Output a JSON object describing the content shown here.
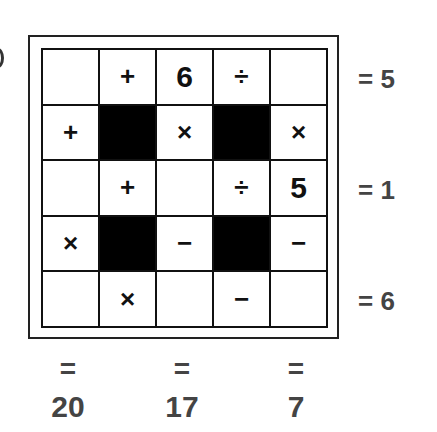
{
  "puzzle": {
    "type": "math-crossword-grid",
    "rows": 5,
    "cols": 5,
    "cells": [
      [
        {
          "kind": "blank",
          "value": ""
        },
        {
          "kind": "op",
          "value": "+"
        },
        {
          "kind": "num",
          "value": "6"
        },
        {
          "kind": "op",
          "value": "÷"
        },
        {
          "kind": "blank",
          "value": ""
        }
      ],
      [
        {
          "kind": "op",
          "value": "+"
        },
        {
          "kind": "black",
          "value": ""
        },
        {
          "kind": "op",
          "value": "×"
        },
        {
          "kind": "black",
          "value": ""
        },
        {
          "kind": "op",
          "value": "×"
        }
      ],
      [
        {
          "kind": "blank",
          "value": ""
        },
        {
          "kind": "op",
          "value": "+"
        },
        {
          "kind": "blank",
          "value": ""
        },
        {
          "kind": "op",
          "value": "÷"
        },
        {
          "kind": "num",
          "value": "5"
        }
      ],
      [
        {
          "kind": "op",
          "value": "×"
        },
        {
          "kind": "black",
          "value": ""
        },
        {
          "kind": "op",
          "value": "−"
        },
        {
          "kind": "black",
          "value": ""
        },
        {
          "kind": "op",
          "value": "−"
        }
      ],
      [
        {
          "kind": "blank",
          "value": ""
        },
        {
          "kind": "op",
          "value": "×"
        },
        {
          "kind": "blank",
          "value": ""
        },
        {
          "kind": "op",
          "value": "−"
        },
        {
          "kind": "blank",
          "value": ""
        }
      ]
    ],
    "row_results": [
      {
        "row": 1,
        "label": "= 5"
      },
      {
        "row": 3,
        "label": "= 1"
      },
      {
        "row": 5,
        "label": "= 6"
      }
    ],
    "col_results": [
      {
        "col": 1,
        "eq": "=",
        "value": "20"
      },
      {
        "col": 3,
        "eq": "=",
        "value": "17"
      },
      {
        "col": 5,
        "eq": "=",
        "value": "7"
      }
    ]
  }
}
